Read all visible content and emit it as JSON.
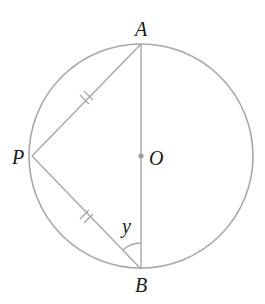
{
  "figure": {
    "type": "circle-geometry",
    "colors": {
      "line": "#a8a8a8",
      "text": "#1a1a1a",
      "center_dot": "#9a9a9a",
      "background": "#ffffff"
    },
    "circle": {
      "center_label": "O",
      "cx": 141,
      "cy": 156,
      "r": 112
    },
    "points": {
      "A": {
        "label": "A",
        "x": 141,
        "y": 44
      },
      "B": {
        "label": "B",
        "x": 141,
        "y": 269
      },
      "P": {
        "label": "P",
        "x": 32,
        "y": 156
      },
      "O": {
        "label": "O",
        "x": 141,
        "y": 156
      }
    },
    "segments": [
      {
        "from": "A",
        "to": "B",
        "name": "diameter"
      },
      {
        "from": "P",
        "to": "A",
        "name": "chord-PA",
        "tick_marks": 2
      },
      {
        "from": "P",
        "to": "B",
        "name": "chord-PB",
        "tick_marks": 2
      }
    ],
    "angle": {
      "label": "y",
      "vertex": "B",
      "between": [
        "P",
        "A"
      ]
    }
  }
}
